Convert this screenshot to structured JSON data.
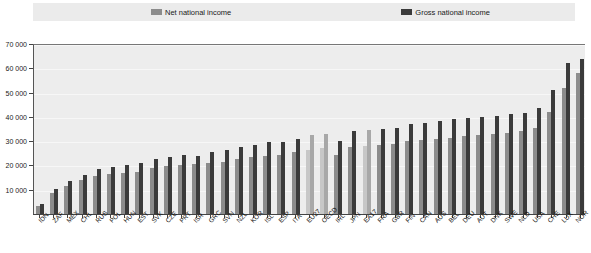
{
  "legend": {
    "entries": [
      {
        "label": "Net national income",
        "color": "#8c8c8c",
        "icon": "legend-swatch-icon"
      },
      {
        "label": "Gross national income",
        "color": "#3b3b3b",
        "icon": "legend-swatch-icon"
      }
    ]
  },
  "chart_data": {
    "type": "bar",
    "title": "",
    "subtitle": "",
    "xlabel": "",
    "ylabel": "",
    "ylim": [
      0,
      70000
    ],
    "yticks": [
      0,
      10000,
      20000,
      30000,
      40000,
      50000,
      60000,
      70000
    ],
    "ytick_labels": [
      "0",
      "10 000",
      "20 000",
      "30 000",
      "40 000",
      "50 000",
      "60 000",
      "70 000"
    ],
    "grid": true,
    "legend_position": "top",
    "highlighted_categories": [
      "EU27",
      "OECD",
      "EA17"
    ],
    "categories": [
      "IDN",
      "ZAF",
      "MEX",
      "CHL",
      "RUS",
      "POL",
      "HUN",
      "EST",
      "SVK",
      "CZE",
      "PRT",
      "ISR",
      "GRC",
      "SVN",
      "NZL",
      "KOR",
      "ISL",
      "ESP",
      "ITA",
      "EU27",
      "OECD",
      "IRL",
      "JPN",
      "EA17",
      "FRA",
      "GBR",
      "FIN",
      "CAN",
      "AUS",
      "BEL",
      "DEU",
      "AUT",
      "DNK",
      "SWE",
      "NLD",
      "USA",
      "CHE",
      "LUX",
      "NOR"
    ],
    "series": [
      {
        "name": "Net national income",
        "color": "#8c8c8c",
        "values": [
          3300,
          8500,
          11500,
          14000,
          15500,
          16500,
          16800,
          17500,
          19000,
          19800,
          20000,
          20500,
          21000,
          21500,
          22500,
          23500,
          24000,
          24500,
          25500,
          26500,
          27000,
          24500,
          27500,
          28000,
          28500,
          29000,
          30000,
          30500,
          31000,
          31500,
          32000,
          32500,
          33000,
          33500,
          34000,
          35500,
          42000,
          52000,
          58000
        ]
      },
      {
        "name": "Gross national income",
        "color": "#3b3b3b",
        "values": [
          4200,
          10200,
          13500,
          16200,
          18500,
          19500,
          20000,
          21000,
          22500,
          23500,
          24500,
          24000,
          25500,
          26500,
          27500,
          28500,
          29500,
          29500,
          31000,
          32500,
          33000,
          30000,
          34000,
          34500,
          35000,
          35500,
          37000,
          37500,
          38500,
          39000,
          39500,
          40000,
          40500,
          41000,
          41500,
          43500,
          51000,
          62000,
          64000
        ]
      }
    ]
  }
}
